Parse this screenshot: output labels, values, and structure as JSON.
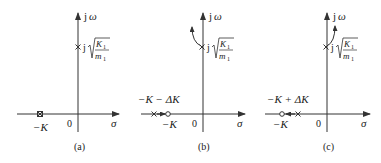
{
  "diagram": {
    "type": "root-locus-pole-zero-plots",
    "colors": {
      "stroke": "#333333",
      "background": "#ffffff"
    },
    "axes": {
      "imag_label_j": "j",
      "imag_label_omega": "ω",
      "real_label": "σ",
      "origin_label": "0"
    },
    "pole_label": {
      "prefix": "j",
      "numerator_K": "K",
      "numerator_sub": "1",
      "denominator_m": "m",
      "denominator_sub": "1"
    },
    "panels": [
      {
        "id": "a",
        "caption": "(a)",
        "left_marker_label": "−K",
        "description": "Pole-zero cancellation at −K (double marker), pole at j√(K1/m1)"
      },
      {
        "id": "b",
        "caption": "(b)",
        "upper_label": "−K − ΔK",
        "lower_label": "−K",
        "description": "Pole at −K−ΔK left of zero at −K; upper pole moves into left half-plane"
      },
      {
        "id": "c",
        "caption": "(c)",
        "upper_label": "−K + ΔK",
        "lower_label": "−K",
        "description": "Pole at −K+ΔK right of zero at −K; upper pole moves into right half-plane"
      }
    ]
  }
}
